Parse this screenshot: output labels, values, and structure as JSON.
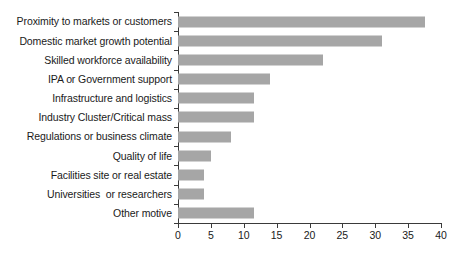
{
  "chart_data": {
    "type": "bar",
    "orientation": "horizontal",
    "title": "",
    "subtitle": "",
    "xlabel": "",
    "ylabel": "",
    "grid": false,
    "legend": null,
    "xlim": [
      0,
      40
    ],
    "xticks": [
      0,
      5,
      10,
      15,
      20,
      25,
      30,
      35,
      40
    ],
    "categories": [
      "Proximity to markets or customers",
      "Domestic market growth potential",
      "Skilled workforce availability",
      "IPA or Government support",
      "Infrastructure and logistics",
      "Industry Cluster/Critical mass",
      "Regulations or business climate",
      "Quality of life",
      "Facilities site or real estate",
      "Universities  or researchers",
      "Other motive"
    ],
    "values": [
      37.5,
      31,
      22,
      14,
      11.5,
      11.5,
      8,
      5,
      4,
      4,
      11.5
    ],
    "bar_color": "#a6a6a6",
    "axis_color": "#3a3a3a",
    "background_color": "#ffffff"
  }
}
